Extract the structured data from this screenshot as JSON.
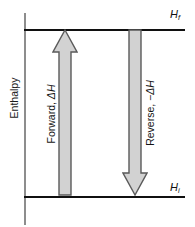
{
  "figure": {
    "axis_title": "Enthalpy",
    "colors": {
      "line": "#101010",
      "axis": "#8d8d8d",
      "arrow_fill": "#d2d2d2",
      "arrow_stroke": "#5a5a5a",
      "background": "#ffffff",
      "text": "#141414"
    }
  },
  "levels": [
    {
      "id": "final",
      "symbol": "H",
      "subscript": "f",
      "position": "top",
      "y_px": 29
    },
    {
      "id": "initial",
      "symbol": "H",
      "subscript": "i",
      "position": "bottom",
      "y_px": 196
    }
  ],
  "arrows": [
    {
      "id": "forward",
      "direction": "up",
      "label_text": "Forward, ",
      "label_delta": "ΔH",
      "from_level": "initial",
      "to_level": "final"
    },
    {
      "id": "reverse",
      "direction": "down",
      "label_text": "Reverse, ",
      "label_delta": "−ΔH",
      "from_level": "final",
      "to_level": "initial"
    }
  ]
}
